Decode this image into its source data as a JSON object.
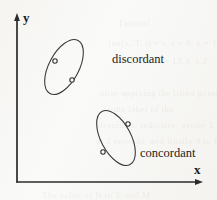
{
  "figure": {
    "background_color": "#f7f7f5",
    "ink_color": "#2b2b2b",
    "axes": {
      "x_label": "x",
      "y_label": "y",
      "origin": [
        17,
        182
      ],
      "x_axis_end": [
        200,
        182
      ],
      "y_axis_end": [
        17,
        16
      ]
    },
    "ghost_text": [
      {
        "text": "Tutorial",
        "x": 118,
        "y": 18,
        "size": 9
      },
      {
        "text": "fun(x, T, t) = t, x = 0,  n = 1, 1",
        "x": 108,
        "y": 38,
        "size": 9
      },
      {
        "text": "G = 17.56        G = 13.4, 1.2",
        "x": 112,
        "y": 56,
        "size": 9
      },
      {
        "text": "after applying the lifted points are labeled",
        "x": 100,
        "y": 88,
        "size": 9
      },
      {
        "text": "is the label of the",
        "x": 104,
        "y": 104,
        "size": 9
      },
      {
        "text": "describes, indicates, vector 2 locations",
        "x": 98,
        "y": 120,
        "size": 9
      },
      {
        "text": "at 2 seconds, and finally 9 to 8 is 2",
        "x": 96,
        "y": 136,
        "size": 9
      },
      {
        "text": "The value of N to 3, and M",
        "x": 42,
        "y": 190,
        "size": 9
      }
    ],
    "clusters": [
      {
        "name": "discordant",
        "label": "discordant",
        "label_position": [
          112,
          53
        ],
        "ellipse": {
          "cx": 64,
          "cy": 67,
          "rx": 15,
          "ry": 30,
          "rotation_deg": 28
        },
        "points": [
          {
            "x": 55,
            "y": 61
          },
          {
            "x": 72,
            "y": 80
          }
        ],
        "orientation": "negative-slope"
      },
      {
        "name": "concordant",
        "label": "concordant",
        "label_position": [
          140,
          147
        ],
        "ellipse": {
          "cx": 116,
          "cy": 138,
          "rx": 15,
          "ry": 30,
          "rotation_deg": -28
        },
        "points": [
          {
            "x": 128,
            "y": 124
          },
          {
            "x": 103,
            "y": 152
          }
        ],
        "orientation": "positive-slope"
      }
    ]
  }
}
